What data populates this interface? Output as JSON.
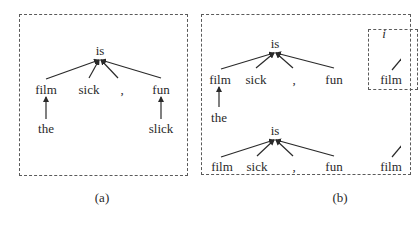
{
  "figure": {
    "panel_a": {
      "caption": "(a)",
      "root": "is",
      "children": [
        "film",
        "sick",
        ",",
        "fun"
      ],
      "grandchildren": {
        "film": "the",
        "fun": "slick"
      }
    },
    "panel_b": {
      "caption": "(b)",
      "tree_top": {
        "root": "is",
        "children": [
          "film",
          "sick",
          ",",
          "fun"
        ],
        "grandchildren": {
          "film": "the"
        }
      },
      "tree_bottom": {
        "root": "is",
        "children": [
          "film",
          "sick",
          ",",
          "fun"
        ]
      },
      "inner_box_partial": {
        "root_partial": "i",
        "child": "film"
      },
      "cut_off_right_child": "film"
    },
    "colors": {
      "text": "#2a2a2a",
      "edges": "#2a2a2a",
      "dashed_border": "#5a5a5a"
    }
  }
}
